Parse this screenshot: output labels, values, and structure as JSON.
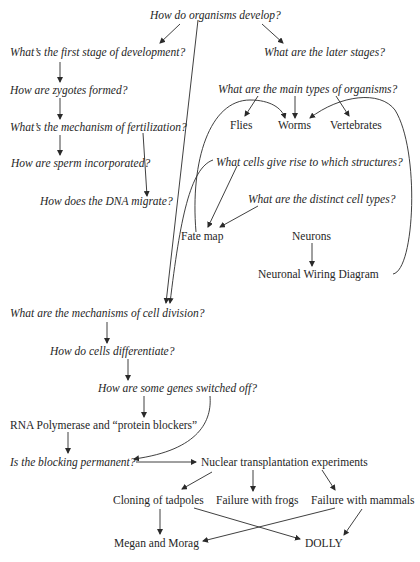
{
  "diagram": {
    "title": "How do organisms develop?",
    "nodes": {
      "root": "How do organisms develop?",
      "first_stage": "What’s the first stage of development?",
      "later_stages": "What are the later stages?",
      "zygotes": "How are zygotes formed?",
      "fertilization": "What’s the mechanism of fertilization?",
      "sperm": "How are sperm incorporated?",
      "dna": "How does the DNA migrate?",
      "main_types": "What are the main types of organisms?",
      "flies": "Flies",
      "worms": "Worms",
      "vertebrates": "Vertebrates",
      "cells_structures": "What cells give rise to which structures?",
      "cell_types": "What are the distinct cell types?",
      "fate_map": "Fate map",
      "neurons": "Neurons",
      "wiring": "Neuronal Wiring Diagram",
      "cell_division": "What are the mechanisms of cell division?",
      "differentiate": "How do cells differentiate?",
      "switched_off": "How are some genes switched off?",
      "rna": "RNA Polymerase and “protein blockers”",
      "permanent": "Is the blocking permanent?",
      "nuclear": "Nuclear transplantation experiments",
      "tadpoles": "Cloning of tadpoles",
      "frogs": "Failure with frogs",
      "mammals": "Failure with mammals",
      "megan": "Megan and Morag",
      "dolly": "DOLLY"
    },
    "edges": [
      [
        "root",
        "first_stage"
      ],
      [
        "root",
        "later_stages"
      ],
      [
        "root",
        "cell_division"
      ],
      [
        "first_stage",
        "zygotes"
      ],
      [
        "zygotes",
        "fertilization"
      ],
      [
        "fertilization",
        "sperm"
      ],
      [
        "fertilization",
        "dna"
      ],
      [
        "main_types",
        "flies"
      ],
      [
        "main_types",
        "worms"
      ],
      [
        "main_types",
        "vertebrates"
      ],
      [
        "fate_map",
        "worms"
      ],
      [
        "wiring",
        "worms"
      ],
      [
        "cells_structures",
        "fate_map"
      ],
      [
        "cells_structures",
        "cell_division"
      ],
      [
        "cell_types",
        "fate_map"
      ],
      [
        "neurons",
        "wiring"
      ],
      [
        "cell_division",
        "differentiate"
      ],
      [
        "differentiate",
        "switched_off"
      ],
      [
        "switched_off",
        "rna"
      ],
      [
        "switched_off",
        "permanent"
      ],
      [
        "rna",
        "permanent"
      ],
      [
        "permanent",
        "nuclear"
      ],
      [
        "nuclear",
        "tadpoles"
      ],
      [
        "nuclear",
        "frogs"
      ],
      [
        "nuclear",
        "mammals"
      ],
      [
        "tadpoles",
        "megan"
      ],
      [
        "tadpoles",
        "dolly"
      ],
      [
        "mammals",
        "megan"
      ],
      [
        "mammals",
        "dolly"
      ]
    ]
  }
}
